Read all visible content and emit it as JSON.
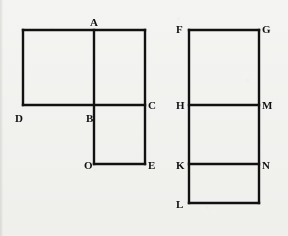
{
  "image": {
    "width": 288,
    "height": 236,
    "background_color": "#f4f4f2",
    "ink_color": "#111111",
    "description": "Two line-drawn rectilinear geometry figures side by side with labelled vertices"
  },
  "figures": [
    {
      "id": "left-figure",
      "name": "L-shaped composite rectangle figure",
      "labels": [
        "A",
        "D",
        "B",
        "C",
        "O",
        "E"
      ],
      "vertices": [
        {
          "label": "A",
          "x": 94,
          "y": 30,
          "label_x": 90,
          "label_y": 17
        },
        {
          "label": "D",
          "x": 23,
          "y": 105,
          "label_x": 15,
          "label_y": 113
        },
        {
          "label": "B",
          "x": 94,
          "y": 105,
          "label_x": 86,
          "label_y": 113
        },
        {
          "label": "C",
          "x": 145,
          "y": 105,
          "label_x": 148,
          "label_y": 100
        },
        {
          "label": "O",
          "x": 94,
          "y": 164,
          "label_x": 84,
          "label_y": 160
        },
        {
          "label": "E",
          "x": 145,
          "y": 164,
          "label_x": 148,
          "label_y": 160
        }
      ],
      "segments": [
        {
          "name": "top-edge-D-top-to-C-top",
          "x1": 23,
          "y1": 30,
          "x2": 145,
          "y2": 30
        },
        {
          "name": "left-edge-to-D",
          "x1": 23,
          "y1": 30,
          "x2": 23,
          "y2": 105
        },
        {
          "name": "middle-horizontal-D-B-C",
          "x1": 23,
          "y1": 105,
          "x2": 145,
          "y2": 105
        },
        {
          "name": "vertical-A-B-O",
          "x1": 94,
          "y1": 30,
          "x2": 94,
          "y2": 164
        },
        {
          "name": "right-edge-C-to-E",
          "x1": 145,
          "y1": 30,
          "x2": 145,
          "y2": 164
        },
        {
          "name": "bottom-edge-O-E",
          "x1": 94,
          "y1": 164,
          "x2": 145,
          "y2": 164
        }
      ]
    },
    {
      "id": "right-figure",
      "name": "Tall rectangle divided into three stacked rectangles",
      "labels": [
        "F",
        "G",
        "H",
        "M",
        "K",
        "N",
        "L"
      ],
      "vertices": [
        {
          "label": "F",
          "x": 189,
          "y": 30,
          "label_x": 176,
          "label_y": 24
        },
        {
          "label": "G",
          "x": 259,
          "y": 30,
          "label_x": 262,
          "label_y": 24
        },
        {
          "label": "H",
          "x": 189,
          "y": 105,
          "label_x": 176,
          "label_y": 100
        },
        {
          "label": "M",
          "x": 259,
          "y": 105,
          "label_x": 262,
          "label_y": 100
        },
        {
          "label": "K",
          "x": 189,
          "y": 164,
          "label_x": 176,
          "label_y": 160
        },
        {
          "label": "N",
          "x": 259,
          "y": 164,
          "label_x": 262,
          "label_y": 160
        },
        {
          "label": "L",
          "x": 189,
          "y": 203,
          "label_x": 176,
          "label_y": 199
        }
      ],
      "segments": [
        {
          "name": "top-edge-F-G",
          "x1": 189,
          "y1": 30,
          "x2": 259,
          "y2": 30
        },
        {
          "name": "left-edge-F-H-K-L",
          "x1": 189,
          "y1": 30,
          "x2": 189,
          "y2": 203
        },
        {
          "name": "right-edge-G-M-N",
          "x1": 259,
          "y1": 30,
          "x2": 259,
          "y2": 203
        },
        {
          "name": "divider-H-M",
          "x1": 189,
          "y1": 105,
          "x2": 259,
          "y2": 105
        },
        {
          "name": "divider-K-N",
          "x1": 189,
          "y1": 164,
          "x2": 259,
          "y2": 164
        },
        {
          "name": "bottom-edge-L",
          "x1": 189,
          "y1": 203,
          "x2": 259,
          "y2": 203
        }
      ]
    }
  ]
}
